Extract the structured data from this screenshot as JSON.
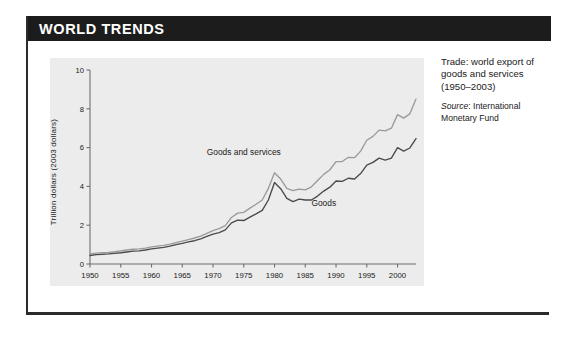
{
  "card": {
    "header_title": "WORLD TRENDS"
  },
  "caption": {
    "main": "Trade: world export of goods and services (1950–2003)",
    "source_word": "Source",
    "source_sep": ": ",
    "source_text": "International Monetary Fund"
  },
  "colors": {
    "header_bg": "#1c1c1c",
    "header_text": "#ffffff",
    "card_bg": "#ffffff",
    "card_border": "#2b2b2b",
    "plot_bg": "#ececec",
    "axis": "#6f6f6f",
    "text": "#1a1a1a",
    "series_goods_and_services": "#9a9a9a",
    "series_goods": "#4a4a4a"
  },
  "chart_data": {
    "type": "line",
    "title": "Trade: world export of goods and services (1950–2003)",
    "xlabel": "",
    "ylabel": "Trillion dollars (2003 dollars)",
    "xlim": [
      1950,
      2003
    ],
    "ylim": [
      0,
      10
    ],
    "grid": false,
    "legend_position": "inline-annotation",
    "xticks": [
      1950,
      1955,
      1960,
      1965,
      1970,
      1975,
      1980,
      1985,
      1990,
      1995,
      2000
    ],
    "xtick_labels": [
      "1950",
      "1955",
      "1960",
      "1965",
      "1970",
      "1975",
      "1980",
      "1985",
      "1990",
      "1995",
      "2000"
    ],
    "yticks": [
      0,
      2,
      4,
      6,
      8,
      10
    ],
    "ytick_labels": [
      "0",
      "2",
      "4",
      "6",
      "8",
      "10"
    ],
    "x": [
      1950,
      1951,
      1952,
      1953,
      1954,
      1955,
      1956,
      1957,
      1958,
      1959,
      1960,
      1961,
      1962,
      1963,
      1964,
      1965,
      1966,
      1967,
      1968,
      1969,
      1970,
      1971,
      1972,
      1973,
      1974,
      1975,
      1976,
      1977,
      1978,
      1979,
      1980,
      1981,
      1982,
      1983,
      1984,
      1985,
      1986,
      1987,
      1988,
      1989,
      1990,
      1991,
      1992,
      1993,
      1994,
      1995,
      1996,
      1997,
      1998,
      1999,
      2000,
      2001,
      2002,
      2003
    ],
    "series": [
      {
        "name": "Goods and services",
        "color": "#9a9a9a",
        "label_x": 1975,
        "label_y": 5.6,
        "values": [
          0.52,
          0.56,
          0.58,
          0.6,
          0.63,
          0.68,
          0.72,
          0.76,
          0.78,
          0.82,
          0.88,
          0.92,
          0.96,
          1.02,
          1.1,
          1.18,
          1.26,
          1.34,
          1.44,
          1.58,
          1.72,
          1.82,
          1.98,
          2.4,
          2.62,
          2.66,
          2.88,
          3.08,
          3.3,
          3.9,
          4.7,
          4.38,
          3.9,
          3.78,
          3.86,
          3.82,
          3.98,
          4.3,
          4.62,
          4.86,
          5.28,
          5.28,
          5.5,
          5.48,
          5.82,
          6.38,
          6.58,
          6.9,
          6.86,
          7.0,
          7.7,
          7.52,
          7.74,
          8.5
        ]
      },
      {
        "name": "Goods",
        "color": "#4a4a4a",
        "label_x": 1988,
        "label_y": 3.0,
        "values": [
          0.44,
          0.48,
          0.5,
          0.52,
          0.55,
          0.58,
          0.62,
          0.66,
          0.68,
          0.72,
          0.78,
          0.82,
          0.86,
          0.92,
          1.0,
          1.06,
          1.14,
          1.2,
          1.3,
          1.42,
          1.54,
          1.62,
          1.76,
          2.12,
          2.26,
          2.24,
          2.42,
          2.58,
          2.76,
          3.3,
          4.2,
          3.88,
          3.38,
          3.22,
          3.34,
          3.3,
          3.3,
          3.5,
          3.76,
          3.96,
          4.28,
          4.26,
          4.42,
          4.38,
          4.66,
          5.1,
          5.24,
          5.46,
          5.36,
          5.46,
          6.0,
          5.82,
          5.98,
          6.46
        ]
      }
    ]
  }
}
